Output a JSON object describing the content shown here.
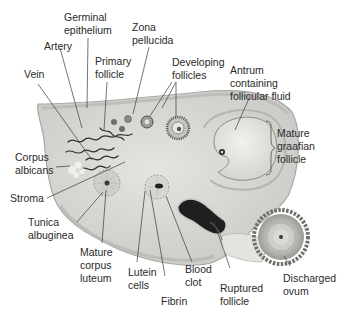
{
  "diagram": {
    "colors": {
      "ovary_fill": "#d9d9d6",
      "ovary_edge": "#a8a8a4",
      "cortex_fill": "#e6e6e2",
      "vessel": "#2e2e2e",
      "blood_clot": "#1f1f1f",
      "ovum_ring": "#7a7a76",
      "label_text": "#2a2a2a",
      "leader_line": "#3a3a3a"
    },
    "labels": {
      "germinal_epithelium": {
        "line1": "Germinal",
        "line2": "epithelium"
      },
      "zona_pellucida": {
        "line1": "Zona",
        "line2": "pellucida"
      },
      "artery": {
        "line1": "Artery"
      },
      "primary_follicle": {
        "line1": "Primary",
        "line2": "follicle"
      },
      "developing_follicles": {
        "line1": "Developing",
        "line2": "follicles"
      },
      "vein": {
        "line1": "Vein"
      },
      "antrum": {
        "line1": "Antrum",
        "line2": "containing",
        "line3": "follicular fluid"
      },
      "mature_graafian_follicle": {
        "line1": "Mature",
        "line2": "graafian",
        "line3": "follicle"
      },
      "corpus_albicans": {
        "line1": "Corpus",
        "line2": "albicans"
      },
      "stroma": {
        "line1": "Stroma"
      },
      "tunica_albuginea": {
        "line1": "Tunica",
        "line2": "albuginea"
      },
      "mature_corpus_luteum": {
        "line1": "Mature",
        "line2": "corpus",
        "line3": "luteum"
      },
      "lutein_cells": {
        "line1": "Lutein",
        "line2": "cells"
      },
      "fibrin": {
        "line1": "Fibrin"
      },
      "blood_clot": {
        "line1": "Blood",
        "line2": "clot"
      },
      "ruptured_follicle": {
        "line1": "Ruptured",
        "line2": "follicle"
      },
      "discharged_ovum": {
        "line1": "Discharged",
        "line2": "ovum"
      }
    }
  }
}
